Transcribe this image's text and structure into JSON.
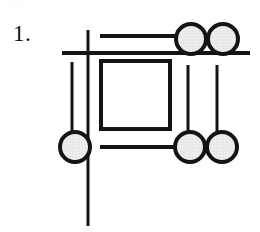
{
  "figure": {
    "label": "1.",
    "bleed_artifact": "rrrrr",
    "caption": "",
    "canvas": {
      "width": 260,
      "height": 232,
      "background": "#ffffff"
    },
    "style": {
      "stroke_color": "#141414",
      "circle_fill": "#e9e9e9",
      "circle_stroke": "#141414",
      "thick_stroke_width": 4,
      "thin_stroke_width": 3,
      "square_stroke_width": 4
    },
    "elements": {
      "long_horizontal_line": {
        "name": "long-horizontal-rule",
        "x1": 62,
        "y1": 53,
        "x2": 250,
        "y2": 53
      },
      "long_vertical_line": {
        "name": "long-vertical-rule",
        "x1": 88,
        "y1": 30,
        "x2": 88,
        "y2": 226
      },
      "upper_short_horizontal": {
        "name": "upper-short-dash",
        "x1": 100,
        "y1": 36,
        "x2": 177,
        "y2": 36
      },
      "lower_short_horizontal": {
        "name": "lower-short-dash",
        "x1": 100,
        "y1": 147,
        "x2": 176,
        "y2": 147
      },
      "left_short_vertical": {
        "name": "left-short-tick",
        "x1": 72,
        "y1": 62,
        "x2": 72,
        "y2": 134
      },
      "right_inner_vertical": {
        "name": "right-inner-tick",
        "x1": 188,
        "y1": 65,
        "x2": 188,
        "y2": 133
      },
      "right_outer_vertical": {
        "name": "right-outer-tick",
        "x1": 217,
        "y1": 65,
        "x2": 217,
        "y2": 133
      },
      "center_square": {
        "name": "center-square",
        "x": 101,
        "y": 61,
        "width": 69,
        "height": 68
      }
    },
    "circles": [
      {
        "name": "circle-top-right-inner",
        "cx": 191,
        "cy": 39,
        "r": 15
      },
      {
        "name": "circle-top-right-outer",
        "cx": 223,
        "cy": 39,
        "r": 15
      },
      {
        "name": "circle-bottom-left",
        "cx": 75,
        "cy": 147,
        "r": 15
      },
      {
        "name": "circle-bottom-right-inner",
        "cx": 190,
        "cy": 147,
        "r": 15
      },
      {
        "name": "circle-bottom-right-outer",
        "cx": 222,
        "cy": 147,
        "r": 15
      }
    ],
    "counts": {
      "total_circles": 5,
      "total_lines": 7,
      "total_squares": 1
    }
  }
}
